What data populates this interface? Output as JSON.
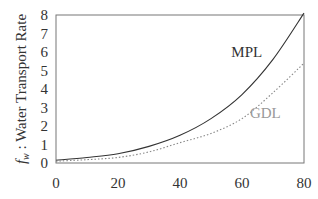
{
  "chart_data": {
    "type": "line",
    "title": "",
    "xlabel": "",
    "ylabel": "f_w : Water Transport Rate",
    "ylabel_italic_prefix": "f",
    "ylabel_subscript": "w",
    "ylabel_rest": " : Water Transport Rate",
    "xlim": [
      0,
      80
    ],
    "ylim": [
      0,
      8
    ],
    "xticks": [
      0,
      20,
      40,
      60,
      80
    ],
    "yticks": [
      0,
      1,
      2,
      3,
      4,
      5,
      6,
      7,
      8
    ],
    "grid": false,
    "legend_position": "inline annotations",
    "x": [
      0,
      10,
      20,
      30,
      40,
      50,
      60,
      70,
      80
    ],
    "series": [
      {
        "name": "MPL",
        "style": "solid",
        "color": "#333333",
        "values": [
          0.15,
          0.3,
          0.5,
          0.9,
          1.5,
          2.4,
          3.7,
          5.6,
          8.1
        ]
      },
      {
        "name": "GDL",
        "style": "dotted",
        "color": "#888888",
        "values": [
          0.1,
          0.18,
          0.3,
          0.6,
          1.1,
          1.6,
          2.4,
          3.8,
          5.4
        ]
      }
    ],
    "annotations": [
      {
        "text": "MPL",
        "x": 63,
        "y": 6.0,
        "color": "#333333"
      },
      {
        "text": "GDL",
        "x": 69,
        "y": 2.7,
        "color": "#999999"
      }
    ]
  }
}
